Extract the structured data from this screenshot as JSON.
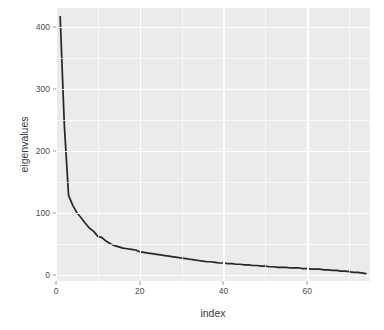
{
  "chart_data": {
    "type": "line",
    "title": "",
    "xlabel": "index",
    "ylabel": "eigenvalues",
    "xlim": [
      0,
      75
    ],
    "ylim": [
      -10,
      430
    ],
    "grid": true,
    "legend": "none",
    "line_color": "#262626",
    "panel_color": "#ebebeb",
    "grid_color": "#ffffff",
    "x_ticks": [
      0,
      20,
      40,
      60
    ],
    "x_tick_labels": [
      "0",
      "20",
      "40",
      "60"
    ],
    "x_minor_ticks": [
      10,
      30,
      50,
      70
    ],
    "y_ticks": [
      0,
      100,
      200,
      300,
      400
    ],
    "y_tick_labels": [
      "0",
      "100",
      "200",
      "300",
      "400"
    ],
    "y_minor_ticks": [
      50,
      150,
      250,
      350
    ],
    "x": [
      1,
      2,
      3,
      4,
      5,
      6,
      7,
      8,
      9,
      10,
      11,
      12,
      13,
      14,
      15,
      16,
      17,
      18,
      19,
      20,
      21,
      22,
      23,
      24,
      25,
      26,
      27,
      28,
      29,
      30,
      31,
      32,
      33,
      34,
      35,
      36,
      37,
      38,
      39,
      40,
      41,
      42,
      43,
      44,
      45,
      46,
      47,
      48,
      49,
      50,
      51,
      52,
      53,
      54,
      55,
      56,
      57,
      58,
      59,
      60,
      61,
      62,
      63,
      64,
      65,
      66,
      67,
      68,
      69,
      70,
      71,
      72,
      73,
      74
    ],
    "y": [
      416,
      240,
      128,
      112,
      100,
      92,
      83,
      75,
      70,
      62,
      60,
      54,
      50,
      47,
      45,
      43,
      42,
      41,
      40,
      37,
      36,
      35,
      34,
      33,
      32,
      31,
      30,
      29,
      28,
      27,
      26,
      25,
      24,
      23,
      22,
      21,
      21,
      20,
      19,
      19,
      18,
      18,
      17,
      17,
      16,
      16,
      15,
      15,
      14,
      14,
      13,
      13,
      12,
      12,
      12,
      11,
      11,
      11,
      10,
      10,
      9,
      9,
      9,
      8,
      8,
      7,
      7,
      6,
      6,
      5,
      4,
      4,
      3,
      2
    ],
    "series_name": "eigenvalues"
  },
  "axis": {
    "x_title": "index",
    "y_title": "eigenvalues"
  }
}
